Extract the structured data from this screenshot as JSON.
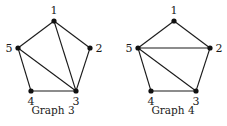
{
  "graphs": [
    {
      "caption": "Graph 3",
      "nodes": [
        "1",
        "2",
        "3",
        "4",
        "5"
      ],
      "edges": [
        [
          "1",
          "5"
        ],
        [
          "1",
          "2"
        ],
        [
          "1",
          "3"
        ],
        [
          "2",
          "3"
        ],
        [
          "3",
          "4"
        ],
        [
          "4",
          "5"
        ],
        [
          "5",
          "3"
        ]
      ]
    },
    {
      "caption": "Graph 4",
      "nodes": [
        "1",
        "2",
        "3",
        "4",
        "5"
      ],
      "edges": [
        [
          "1",
          "5"
        ],
        [
          "1",
          "2"
        ],
        [
          "5",
          "2"
        ],
        [
          "2",
          "3"
        ],
        [
          "3",
          "4"
        ],
        [
          "4",
          "5"
        ],
        [
          "5",
          "3"
        ]
      ]
    }
  ]
}
